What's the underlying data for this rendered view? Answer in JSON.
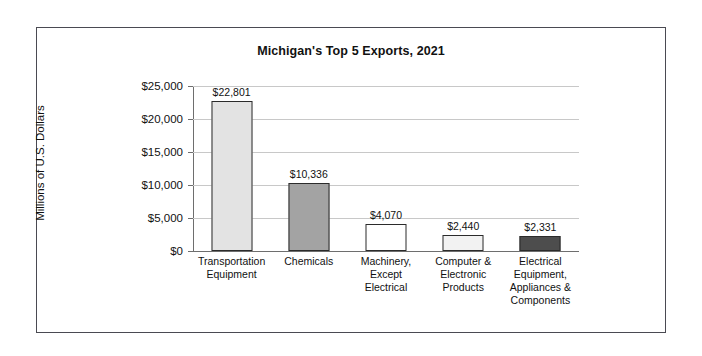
{
  "chart_data": {
    "type": "bar",
    "title": "Michigan's Top 5 Exports, 2021",
    "xlabel": "",
    "ylabel": "Millions of U.S. Dollars",
    "ylim": [
      0,
      25000
    ],
    "ytick_values": [
      0,
      5000,
      10000,
      15000,
      20000,
      25000
    ],
    "ytick_labels": [
      "$0",
      "$5,000",
      "$10,000",
      "$15,000",
      "$20,000",
      "$25,000"
    ],
    "grid": true,
    "legend": "none",
    "categories": [
      "Transportation Equipment",
      "Chemicals",
      "Machinery, Except Electrical",
      "Computer & Electronic Products",
      "Electrical Equipment, Appliances & Components"
    ],
    "values": [
      22801,
      10336,
      4070,
      2440,
      2331
    ],
    "value_labels": [
      "$22,801",
      "$10,336",
      "$4,070",
      "$2,440",
      "$2,331"
    ],
    "bar_colors": [
      "#e3e3e3",
      "#a3a3a3",
      "#ffffff",
      "#f2f2f2",
      "#4d4d4d"
    ],
    "bar_edge_color": "#2b2b2b",
    "bars": [
      {
        "label_line1": "Transportation",
        "label_line2": "Equipment",
        "label_line3": "",
        "label_line4": "",
        "value": 22801,
        "value_label": "$22,801",
        "color": "#e3e3e3"
      },
      {
        "label_line1": "Chemicals",
        "label_line2": "",
        "label_line3": "",
        "label_line4": "",
        "value": 10336,
        "value_label": "$10,336",
        "color": "#a3a3a3"
      },
      {
        "label_line1": "Machinery,",
        "label_line2": "Except",
        "label_line3": "Electrical",
        "label_line4": "",
        "value": 4070,
        "value_label": "$4,070",
        "color": "#ffffff"
      },
      {
        "label_line1": "Computer &",
        "label_line2": "Electronic",
        "label_line3": "Products",
        "label_line4": "",
        "value": 2440,
        "value_label": "$2,440",
        "color": "#f2f2f2"
      },
      {
        "label_line1": "Electrical",
        "label_line2": "Equipment,",
        "label_line3": "Appliances &",
        "label_line4": "Components",
        "value": 2331,
        "value_label": "$2,331",
        "color": "#4d4d4d"
      }
    ]
  }
}
